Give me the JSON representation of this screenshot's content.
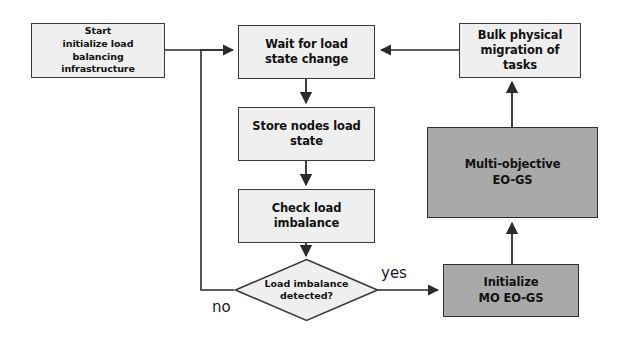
{
  "diagram": {
    "type": "flowchart",
    "colors": {
      "light_fill": "#efefef",
      "shaded_fill": "#a9a9a9",
      "stroke": "#3a3a3a",
      "text": "#111111",
      "background": "#ffffff"
    },
    "nodes": [
      {
        "id": "start",
        "shape": "rectangle",
        "style": "light",
        "label": "Start\ninitialize load balancing\ninfrastructure"
      },
      {
        "id": "wait",
        "shape": "rectangle",
        "style": "light",
        "label": "Wait for load\nstate change"
      },
      {
        "id": "store",
        "shape": "rectangle",
        "style": "light",
        "label": "Store nodes load\nstate"
      },
      {
        "id": "check",
        "shape": "rectangle",
        "style": "light",
        "label": "Check load\nimbalance"
      },
      {
        "id": "decision",
        "shape": "diamond",
        "style": "light",
        "label": "Load imbalance\ndetected?"
      },
      {
        "id": "initialize",
        "shape": "rectangle",
        "style": "shaded",
        "label": "Initialize\nMO EO-GS"
      },
      {
        "id": "multiobjective",
        "shape": "rectangle",
        "style": "shaded",
        "label": "Multi-objective\nEO-GS"
      },
      {
        "id": "bulk",
        "shape": "rectangle",
        "style": "light",
        "label": "Bulk physical\nmigration of tasks"
      }
    ],
    "edge_labels": {
      "yes": "yes",
      "no": "no"
    },
    "edges": [
      {
        "from": "start",
        "to": "wait",
        "label": ""
      },
      {
        "from": "wait",
        "to": "store",
        "label": ""
      },
      {
        "from": "store",
        "to": "check",
        "label": ""
      },
      {
        "from": "check",
        "to": "decision",
        "label": ""
      },
      {
        "from": "decision",
        "to": "initialize",
        "label": "yes"
      },
      {
        "from": "decision",
        "to": "wait",
        "label": "no"
      },
      {
        "from": "initialize",
        "to": "multiobjective",
        "label": ""
      },
      {
        "from": "multiobjective",
        "to": "bulk",
        "label": ""
      },
      {
        "from": "bulk",
        "to": "wait",
        "label": ""
      }
    ]
  }
}
